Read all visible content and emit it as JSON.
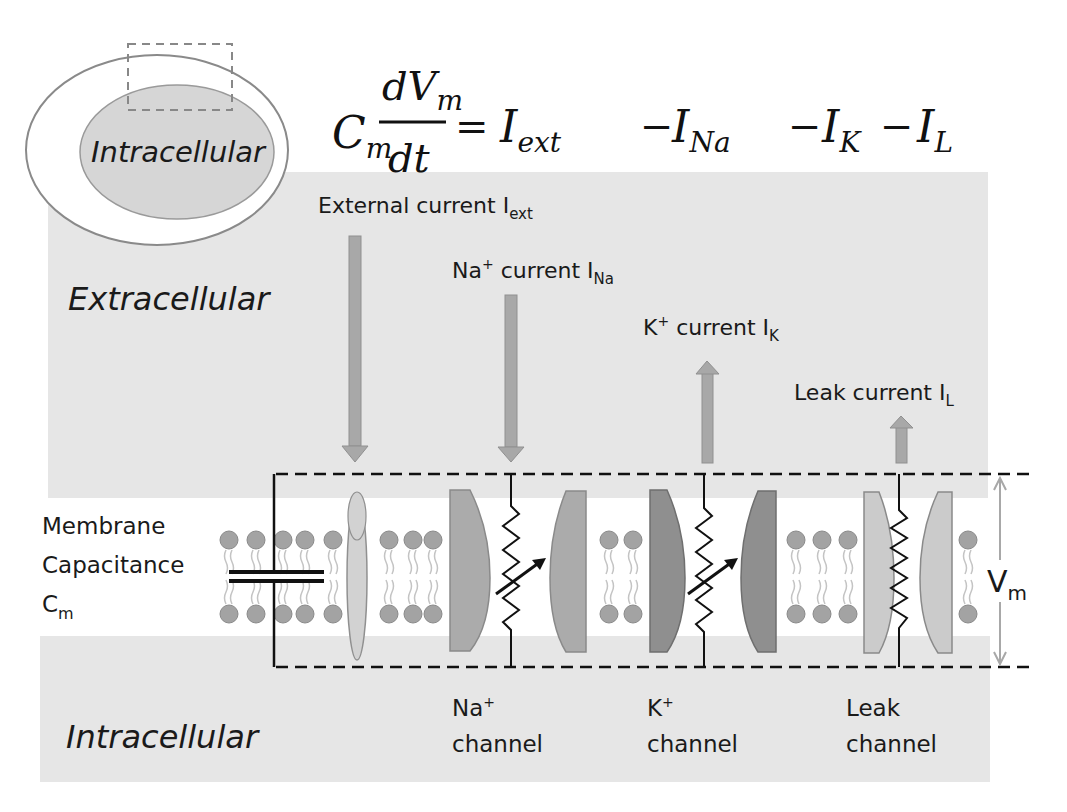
{
  "colors": {
    "band": "#e6e6e6",
    "membrane_white": "#ffffff",
    "lipid_head": "#a3a3a3",
    "lipid_tail": "#c4c4c4",
    "arrow_fill": "#a8a8a8",
    "na_channel": "#ababab",
    "k_channel": "#8f8f8f",
    "leak_channel": "#cbcbcb",
    "pump_oval": "#d2d2d2",
    "line_dark": "#111111",
    "vm_arrow": "#a8a8a8"
  },
  "cell_inset": {
    "inner_label": "Intracellular"
  },
  "equation": {
    "lhs_C": "C",
    "lhs_C_sub": "m",
    "frac_num_d": "dV",
    "frac_num_sub": "m",
    "frac_den": "dt",
    "equals": "=",
    "term1": "I",
    "term1_sub": "ext",
    "minus1": "−",
    "term2": "I",
    "term2_sub": "Na",
    "minus2": "−",
    "term3": "I",
    "term3_sub": "K",
    "minus3": "−",
    "term4": "I",
    "term4_sub": "L"
  },
  "regions": {
    "extracellular": "Extracellular",
    "intracellular": "Intracellular"
  },
  "currents": {
    "ext": {
      "label": "External current I",
      "sub": "ext",
      "direction": "inward"
    },
    "na": {
      "label": "current I",
      "ion": "Na",
      "sup": "+",
      "sub": "Na",
      "direction": "inward"
    },
    "k": {
      "label": "current I",
      "ion": "K",
      "sup": "+",
      "sub": "K",
      "direction": "outward"
    },
    "leak": {
      "label": "Leak current I",
      "sub": "L",
      "direction": "outward"
    }
  },
  "membrane": {
    "cap_line1": "Membrane",
    "cap_line2": "Capacitance",
    "cap_line3": "C",
    "cap_sub": "m",
    "vm": "V",
    "vm_sub": "m"
  },
  "channels": [
    {
      "ion": "Na",
      "sup": "+",
      "line2": "channel"
    },
    {
      "ion": "K",
      "sup": "+",
      "line2": "channel"
    },
    {
      "ion": "Leak",
      "sup": "",
      "line2": "channel"
    }
  ]
}
